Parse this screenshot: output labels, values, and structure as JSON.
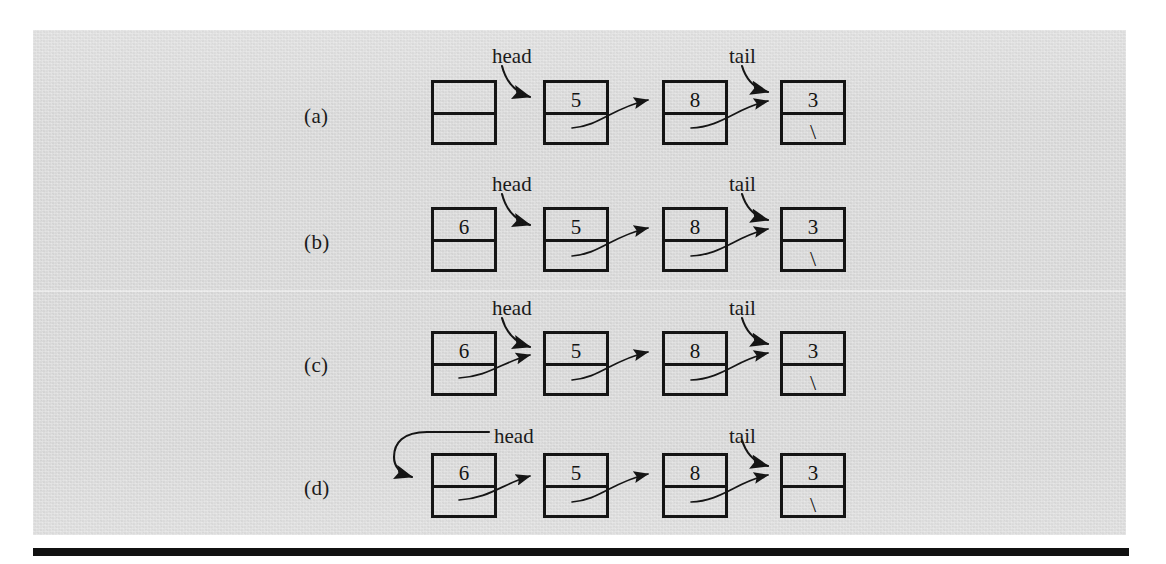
{
  "figure": {
    "caption_labels": [
      "(a)",
      "(b)",
      "(c)",
      "(d)"
    ],
    "null_marker": "\\",
    "pointer_labels": {
      "head": "head",
      "tail": "tail"
    },
    "colors": {
      "paper": "#dcdcdc",
      "ink": "#151515",
      "page": "#ffffff",
      "rule": "#111111"
    }
  },
  "rows": [
    {
      "label": "(a)",
      "head_label": "head",
      "tail_label": "tail",
      "nodes": [
        {
          "value": "",
          "next": ""
        },
        {
          "value": "5",
          "next": ""
        },
        {
          "value": "8",
          "next": ""
        },
        {
          "value": "3",
          "next": "\\"
        }
      ],
      "head_points_to": "node-2",
      "tail_points_to": "node-4",
      "new_node_linked": false
    },
    {
      "label": "(b)",
      "head_label": "head",
      "tail_label": "tail",
      "nodes": [
        {
          "value": "6",
          "next": ""
        },
        {
          "value": "5",
          "next": ""
        },
        {
          "value": "8",
          "next": ""
        },
        {
          "value": "3",
          "next": "\\"
        }
      ],
      "head_points_to": "node-2",
      "tail_points_to": "node-4",
      "new_node_linked": false
    },
    {
      "label": "(c)",
      "head_label": "head",
      "tail_label": "tail",
      "nodes": [
        {
          "value": "6",
          "next": ""
        },
        {
          "value": "5",
          "next": ""
        },
        {
          "value": "8",
          "next": ""
        },
        {
          "value": "3",
          "next": "\\"
        }
      ],
      "head_points_to": "node-2",
      "tail_points_to": "node-4",
      "new_node_linked": true
    },
    {
      "label": "(d)",
      "head_label": "head",
      "tail_label": "tail",
      "nodes": [
        {
          "value": "6",
          "next": ""
        },
        {
          "value": "5",
          "next": ""
        },
        {
          "value": "8",
          "next": ""
        },
        {
          "value": "3",
          "next": "\\"
        }
      ],
      "head_points_to": "node-1",
      "tail_points_to": "node-4",
      "new_node_linked": true
    }
  ]
}
